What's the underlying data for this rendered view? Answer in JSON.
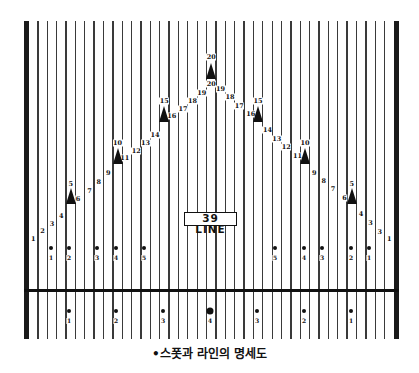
{
  "diagram": {
    "label_box": "39 LINE",
    "caption": "•스폿과 라인의 명세도",
    "board_count": 39,
    "geometry": {
      "lane_left": 28.5,
      "lane_right": 394,
      "board_width": 9.37,
      "lines_top": 21,
      "lines_bottom": 339,
      "foul_line_y": 290,
      "left_gutter_x": 24,
      "right_gutter_x": 394,
      "gutter_width": 5
    },
    "arrows": [
      {
        "board": 5,
        "tip_y": 188,
        "label": "5",
        "label_y": 184
      },
      {
        "board": 10,
        "tip_y": 148,
        "label": "10",
        "label_y": 143
      },
      {
        "board": 15,
        "tip_y": 106,
        "label": "15",
        "label_y": 101
      },
      {
        "board": 20,
        "tip_y": 63,
        "label": "20",
        "label_y": 57
      },
      {
        "board": 25,
        "tip_y": 106,
        "label": "15",
        "label_y": 101
      },
      {
        "board": 30,
        "tip_y": 148,
        "label": "10",
        "label_y": 143
      },
      {
        "board": 35,
        "tip_y": 188,
        "label": "5",
        "label_y": 184
      }
    ],
    "board_numbers": [
      {
        "board": 1,
        "text": "1",
        "y": 239
      },
      {
        "board": 2,
        "text": "2",
        "y": 231
      },
      {
        "board": 3,
        "text": "3",
        "y": 224
      },
      {
        "board": 4,
        "text": "4",
        "y": 216
      },
      {
        "board": 6,
        "text": "6",
        "y": 199,
        "dx": -2
      },
      {
        "board": 7,
        "text": "7",
        "y": 191
      },
      {
        "board": 8,
        "text": "8",
        "y": 182
      },
      {
        "board": 9,
        "text": "9",
        "y": 173
      },
      {
        "board": 11,
        "text": "11",
        "y": 158,
        "dx": -2
      },
      {
        "board": 12,
        "text": "12",
        "y": 151
      },
      {
        "board": 13,
        "text": "13",
        "y": 143
      },
      {
        "board": 14,
        "text": "14",
        "y": 135
      },
      {
        "board": 16,
        "text": "16",
        "y": 116,
        "dx": -2
      },
      {
        "board": 17,
        "text": "17",
        "y": 109
      },
      {
        "board": 18,
        "text": "18",
        "y": 101
      },
      {
        "board": 19,
        "text": "19",
        "y": 93
      },
      {
        "board": 20,
        "text": "20",
        "y": 84
      },
      {
        "board": 21,
        "text": "19",
        "y": 89
      },
      {
        "board": 22,
        "text": "18",
        "y": 97
      },
      {
        "board": 23,
        "text": "17",
        "y": 106
      },
      {
        "board": 24,
        "text": "16",
        "y": 114,
        "dx": 2
      },
      {
        "board": 26,
        "text": "14",
        "y": 130
      },
      {
        "board": 27,
        "text": "13",
        "y": 139
      },
      {
        "board": 28,
        "text": "12",
        "y": 147
      },
      {
        "board": 29,
        "text": "11",
        "y": 156,
        "dx": 2
      },
      {
        "board": 31,
        "text": "9",
        "y": 173
      },
      {
        "board": 32,
        "text": "8",
        "y": 181
      },
      {
        "board": 33,
        "text": "7",
        "y": 189
      },
      {
        "board": 34,
        "text": "6",
        "y": 198,
        "dx": 2
      },
      {
        "board": 36,
        "text": "4",
        "y": 214
      },
      {
        "board": 37,
        "text": "3",
        "y": 223
      },
      {
        "board": 38,
        "text": "3",
        "y": 232
      },
      {
        "board": 39,
        "text": "1",
        "y": 239
      }
    ],
    "upper_dots": {
      "y": 248,
      "label_y": 255,
      "items": [
        {
          "x": 51,
          "label": "1"
        },
        {
          "x": 69,
          "label": "2"
        },
        {
          "x": 97,
          "label": "3"
        },
        {
          "x": 116,
          "label": "4"
        },
        {
          "x": 144,
          "label": "5"
        },
        {
          "x": 275,
          "label": "5"
        },
        {
          "x": 304,
          "label": "4"
        },
        {
          "x": 322,
          "label": "3"
        },
        {
          "x": 351,
          "label": "2"
        },
        {
          "x": 369,
          "label": "1"
        }
      ]
    },
    "lower_dots": {
      "y": 311,
      "label_y": 318,
      "items": [
        {
          "x": 69,
          "label": "1"
        },
        {
          "x": 116,
          "label": "2"
        },
        {
          "x": 163,
          "label": "3"
        },
        {
          "x": 210,
          "label": "4",
          "big": true
        },
        {
          "x": 257,
          "label": "3"
        },
        {
          "x": 304,
          "label": "2"
        },
        {
          "x": 351,
          "label": "1"
        }
      ]
    },
    "label_box_geometry": {
      "x": 184,
      "y": 212,
      "w": 53,
      "h": 14
    },
    "caption_y": 344
  }
}
